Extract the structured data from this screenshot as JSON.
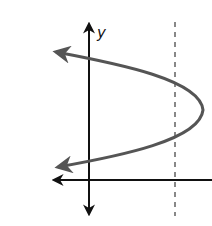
{
  "diagram": {
    "type": "sideways-parabola",
    "labels": {
      "y_axis": "y"
    },
    "colors": {
      "axes": "#111111",
      "curve": "#555555",
      "dashed_line": "#888888",
      "background": "#ffffff"
    },
    "curve": {
      "opens": "left",
      "vertex_px": [
        203,
        110
      ],
      "upper_end_px": [
        53,
        51
      ],
      "lower_end_px": [
        55,
        168
      ]
    },
    "dashed_line": {
      "orientation": "vertical",
      "x_px": 175
    }
  }
}
